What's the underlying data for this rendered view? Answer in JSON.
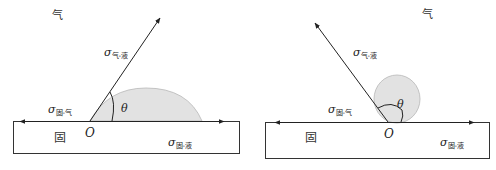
{
  "colors": {
    "line": "#222222",
    "drop_fill": "#e2e2e2",
    "drop_edge": "#b8b8b8",
    "background": "#ffffff"
  },
  "panels": [
    {
      "id": "left",
      "description": "Wetting case: contact angle θ < 90°",
      "phase_gas": "气",
      "phase_solid": "固",
      "origin_label": "O",
      "angle_label": "θ",
      "sigma_symbol": "σ",
      "tension_gas_liquid_sub": "气-液",
      "tension_solid_gas_sub": "固-气",
      "tension_solid_liquid_sub": "固-液"
    },
    {
      "id": "right",
      "description": "Non-wetting case: contact angle θ > 90°",
      "phase_gas": "气",
      "phase_solid": "固",
      "origin_label": "O",
      "angle_label": "θ",
      "sigma_symbol": "σ",
      "tension_gas_liquid_sub": "气-液",
      "tension_solid_gas_sub": "固-气",
      "tension_solid_liquid_sub": "固-液"
    }
  ]
}
